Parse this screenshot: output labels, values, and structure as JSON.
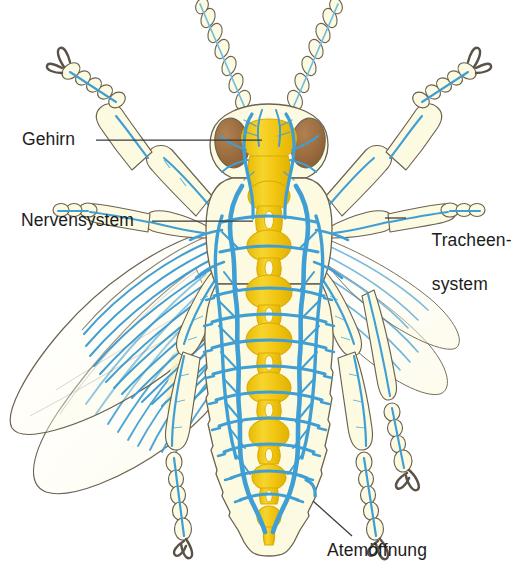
{
  "figure": {
    "organism": "Insekt",
    "view": "Aufsicht"
  },
  "labels": {
    "brain": "Gehirn",
    "nervous_system": "Nervensystem",
    "tracheal_system_line1": "Tracheen-",
    "tracheal_system_line2": "system",
    "spiracle": "Atemöffnung"
  },
  "colors": {
    "background": "#ffffff",
    "body_fill": "#fcf8d8",
    "body_fill_light": "#fdfbe8",
    "nerve_cord": "#f2c511",
    "nerve_cord_dark": "#e8b906",
    "nerve_cord_light": "#f7d945",
    "trachea": "#3f9fd4",
    "trachea_light": "#6fbde3",
    "eye": "#9c6b3c",
    "eye_dark": "#7d5129",
    "outline": "#6b6250",
    "leader_line": "#3a3a3a",
    "claw": "#5a5246",
    "text": "#1c1c1c"
  },
  "anatomy": {
    "parts": [
      "Antenne",
      "Komplexauge",
      "Gehirn",
      "Unterschlundganglion",
      "Bauchmark",
      "Ganglienkette",
      "Längstrachee",
      "Quertrachee",
      "Atemöffnung",
      "Vorderflügel",
      "Hinterflügel",
      "Vorderbein",
      "Mittelbein",
      "Hinterbein",
      "Tarsus",
      "Klaue",
      "Abdominalsegment"
    ],
    "ganglia_count": 11,
    "abdominal_segments": 9,
    "leg_pairs": 3,
    "wing_pairs": 2,
    "antenna_segments": 9
  },
  "leaders": [
    {
      "name": "brain-leader",
      "x1": 96,
      "y1": 140,
      "x2": 262,
      "y2": 140
    },
    {
      "name": "nerve-leader",
      "x1": 152,
      "y1": 221,
      "x2": 253,
      "y2": 221
    },
    {
      "name": "trachea-leader",
      "x1": 385,
      "y1": 218,
      "x2": 406,
      "y2": 218
    },
    {
      "name": "spiracle-leader",
      "x1": 313,
      "y1": 501,
      "x2": 352,
      "y2": 536
    }
  ]
}
